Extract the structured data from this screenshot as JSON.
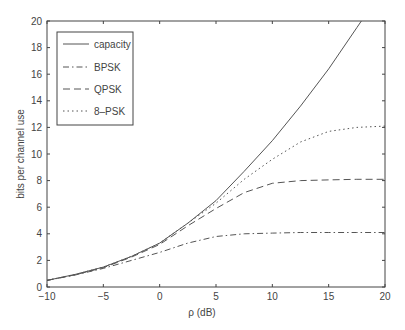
{
  "chart_data": {
    "type": "line",
    "title": "",
    "xlabel": "ρ (dB)",
    "ylabel": "bits per channel use",
    "xlim": [
      -10,
      20
    ],
    "ylim": [
      0,
      20
    ],
    "grid": false,
    "legend_position": "upper-left",
    "xticks": [
      -10,
      -5,
      0,
      5,
      10,
      15,
      20
    ],
    "yticks": [
      0,
      2,
      4,
      6,
      8,
      10,
      12,
      14,
      16,
      18,
      20
    ],
    "x": [
      -10,
      -7.5,
      -5,
      -2.5,
      0,
      2.5,
      5,
      7.5,
      10,
      12.5,
      15,
      17.5,
      20
    ],
    "series": [
      {
        "name": "capacity",
        "style": "solid",
        "values": [
          0.5,
          0.95,
          1.5,
          2.3,
          3.3,
          4.8,
          6.5,
          8.7,
          11.0,
          13.6,
          16.4,
          19.5,
          22.6
        ]
      },
      {
        "name": "BPSK",
        "style": "dashdot",
        "values": [
          0.5,
          0.9,
          1.4,
          2.0,
          2.6,
          3.3,
          3.8,
          4.0,
          4.05,
          4.1,
          4.1,
          4.1,
          4.1
        ]
      },
      {
        "name": "QPSK",
        "style": "dashed",
        "values": [
          0.5,
          0.92,
          1.45,
          2.25,
          3.2,
          4.6,
          5.9,
          7.1,
          7.8,
          8.0,
          8.05,
          8.1,
          8.1
        ]
      },
      {
        "name": "8-PSK",
        "style": "dotted",
        "values": [
          0.5,
          0.95,
          1.5,
          2.3,
          3.3,
          4.8,
          6.3,
          8.1,
          9.6,
          10.9,
          11.7,
          12.0,
          12.1
        ]
      }
    ]
  },
  "axes": {
    "xlabel": "ρ (dB)",
    "ylabel": "bits per channel use"
  },
  "legend": {
    "items": [
      {
        "label": "capacity"
      },
      {
        "label": "BPSK"
      },
      {
        "label": "QPSK"
      },
      {
        "label": "8–PSK"
      }
    ]
  },
  "colors": {
    "line": "#555555",
    "axis": "#444444",
    "text": "#444444"
  }
}
